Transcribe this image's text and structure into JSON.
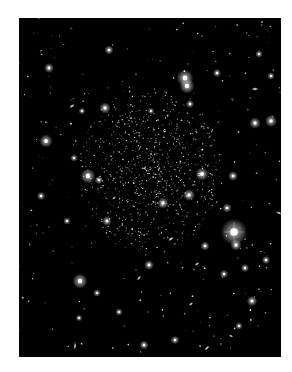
{
  "image": {
    "subject": "Deep-sky astronomical photograph of a faint dwarf galaxy resolved into individual stars, surrounded by foreground stars and background galaxies",
    "alt_text": "Astronomical image: dense faint star cluster at center on black sky with scattered bright stars and small galaxies"
  },
  "colors": {
    "background": "#ffffff",
    "sky": "#000000",
    "star": "#ffffff"
  }
}
